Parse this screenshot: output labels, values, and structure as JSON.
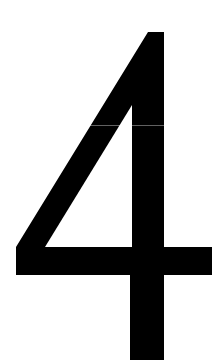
{
  "page": {
    "width": 219,
    "height": 360,
    "background_color": "#ffffff"
  },
  "glyph": {
    "character": "4",
    "name": "numeral-four",
    "fill_color": "#000000",
    "style": "heavy sans-serif, open-top four",
    "cropped_at_bottom": true,
    "outline_path": "M 148,32 L 164,32 L 164,247 L 212,247 L 212,275 L 164,275 L 164,360 L 130,360 L 130,275 L 16,275 L 16,247 L 148,32 Z",
    "counter_path": "M 132,105 L 132,247 L 45,247 Z"
  },
  "artifacts": {
    "scan_seam": {
      "name": "scan-seam-line",
      "y": 125,
      "color": "rgba(255,255,255,0.38)"
    }
  },
  "caption": {
    "alt_text": "4"
  }
}
